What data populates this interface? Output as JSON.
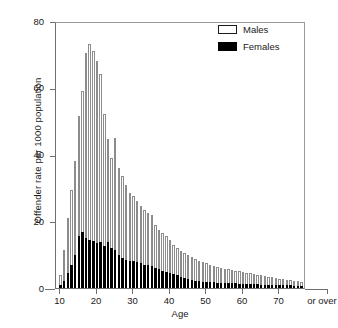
{
  "chart_data": {
    "type": "bar",
    "title": "",
    "xlabel": "Age",
    "ylabel": "Offender rate per 1000 population",
    "ylim": [
      0,
      80
    ],
    "yticks": [
      0,
      20,
      40,
      60,
      80
    ],
    "xticks": [
      10,
      20,
      30,
      40,
      50,
      60,
      70
    ],
    "xtick_extra_label": "or over",
    "xlim": [
      10,
      76
    ],
    "grid": false,
    "legend_position": "top-right",
    "legend": [
      "Males",
      "Females"
    ],
    "categories": [
      10,
      11,
      12,
      13,
      14,
      15,
      16,
      17,
      18,
      19,
      20,
      21,
      22,
      23,
      24,
      25,
      26,
      27,
      28,
      29,
      30,
      31,
      32,
      33,
      34,
      35,
      36,
      37,
      38,
      39,
      40,
      41,
      42,
      43,
      44,
      45,
      46,
      47,
      48,
      49,
      50,
      51,
      52,
      53,
      54,
      55,
      56,
      57,
      58,
      59,
      60,
      61,
      62,
      63,
      64,
      65,
      66,
      67,
      68,
      69,
      70,
      71,
      72,
      73,
      74,
      75,
      76
    ],
    "series": [
      {
        "name": "Males",
        "color": "#ffffff",
        "edge_color": "#8c8c8c",
        "values": [
          4.0,
          11.5,
          21.0,
          29.5,
          38.0,
          51.5,
          59.0,
          70.5,
          73.0,
          71.0,
          68.0,
          64.0,
          52.0,
          44.5,
          39.0,
          45.0,
          36.0,
          33.5,
          31.0,
          28.5,
          27.5,
          26.0,
          24.5,
          23.5,
          22.5,
          22.0,
          19.0,
          17.5,
          16.5,
          15.5,
          14.5,
          13.0,
          12.0,
          11.0,
          10.5,
          9.8,
          9.2,
          8.8,
          8.2,
          7.8,
          7.4,
          7.0,
          6.6,
          6.2,
          6.0,
          5.8,
          5.6,
          5.4,
          5.2,
          5.0,
          4.8,
          4.6,
          4.4,
          4.2,
          4.0,
          3.8,
          3.6,
          3.4,
          3.2,
          3.0,
          2.8,
          2.7,
          2.5,
          2.4,
          2.2,
          2.0,
          1.8
        ]
      },
      {
        "name": "Females",
        "color": "#000000",
        "edge_color": "#000000",
        "values": [
          0.8,
          2.2,
          4.5,
          7.0,
          10.0,
          15.5,
          16.8,
          15.0,
          14.5,
          14.0,
          13.5,
          13.8,
          12.5,
          13.8,
          12.0,
          11.5,
          10.0,
          9.0,
          8.5,
          8.2,
          8.0,
          7.8,
          7.5,
          7.0,
          6.8,
          6.5,
          6.0,
          5.6,
          5.2,
          4.8,
          4.5,
          4.2,
          3.8,
          3.4,
          3.0,
          2.6,
          2.3,
          2.1,
          2.0,
          1.9,
          1.8,
          1.7,
          1.7,
          1.6,
          1.6,
          1.5,
          1.5,
          1.4,
          1.4,
          1.3,
          1.3,
          1.2,
          1.2,
          1.1,
          1.1,
          1.0,
          1.0,
          1.0,
          0.9,
          0.9,
          0.9,
          0.8,
          0.8,
          0.8,
          0.7,
          0.7,
          0.6
        ]
      }
    ]
  }
}
